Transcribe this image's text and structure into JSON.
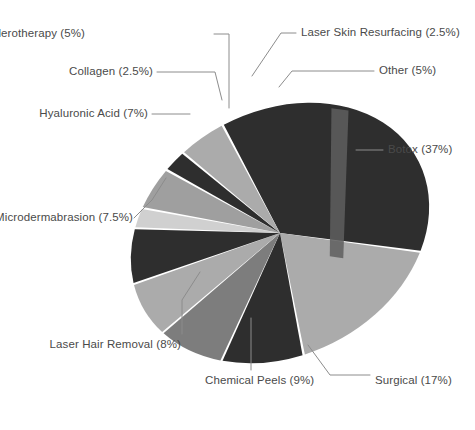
{
  "chart_data": {
    "type": "pie",
    "title": "",
    "subtitle": "",
    "xlabel": "",
    "ylabel": "",
    "legend_position": "external-callout-labels",
    "grid": false,
    "units": "percent",
    "total": 100,
    "style": "tilted elliptical pie, grayscale, leader-line callouts",
    "categories": [
      "Botox",
      "Surgical",
      "Chemical Peels",
      "Laser Hair Removal",
      "Microdermabrasion",
      "Hyaluronic Acid",
      "Collagen",
      "Sclerotherapy",
      "Laser Skin Resurfacing",
      "Other"
    ],
    "values": [
      37,
      17,
      9,
      8,
      7.5,
      7,
      2.5,
      5,
      2.5,
      5
    ],
    "slices": [
      {
        "label": "Botox (37%)",
        "name": "Botox",
        "value": 37,
        "color": "#2e2e2e"
      },
      {
        "label": "Surgical (17%)",
        "name": "Surgical",
        "value": 17,
        "color": "#ababab"
      },
      {
        "label": "Chemical Peels (9%)",
        "name": "Chemical Peels",
        "value": 9,
        "color": "#2e2e2e"
      },
      {
        "label": "Laser Hair Removal (8%)",
        "name": "Laser Hair Removal",
        "value": 8,
        "color": "#7d7d7d"
      },
      {
        "label": "Microdermabrasion (7.5%)",
        "name": "Microdermabrasion",
        "value": 7.5,
        "color": "#ababab"
      },
      {
        "label": "Hyaluronic Acid (7%)",
        "name": "Hyaluronic Acid",
        "value": 7,
        "color": "#2e2e2e"
      },
      {
        "label": "Collagen (2.5%)",
        "name": "Collagen",
        "value": 2.5,
        "color": "#d0d0d0"
      },
      {
        "label": "Sclerotherapy (5%)",
        "name": "Sclerotherapy",
        "value": 5,
        "color": "#9f9f9f"
      },
      {
        "label": "Laser Skin Resurfacing (2.5%)",
        "name": "Laser Skin Resurfacing",
        "value": 2.5,
        "color": "#2e2e2e"
      },
      {
        "label": "Other (5%)",
        "name": "Other",
        "value": 5,
        "color": "#ababab"
      }
    ]
  },
  "labels": {
    "sclerotherapy": "Sclerotherapy (5%)",
    "collagen": "Collagen (2.5%)",
    "hyaluronic_acid": "Hyaluronic Acid (7%)",
    "microdermabrasion": "Microdermabrasion (7.5%)",
    "laser_hair_removal": "Laser Hair Removal (8%)",
    "chemical_peels": "Chemical Peels (9%)",
    "surgical": "Surgical (17%)",
    "botox": "Botox (37%)",
    "other": "Other (5%)",
    "laser_skin_resurfacing": "Laser Skin Resurfacing (2.5%)"
  },
  "colors": {
    "background": "#ffffff",
    "text": "#4a4a4a",
    "leader_line": "#8c8c8c",
    "dark": "#2e2e2e",
    "mid": "#7d7d7d",
    "light": "#ababab",
    "pale": "#d0d0d0",
    "highlight": "#5a5a5a"
  }
}
